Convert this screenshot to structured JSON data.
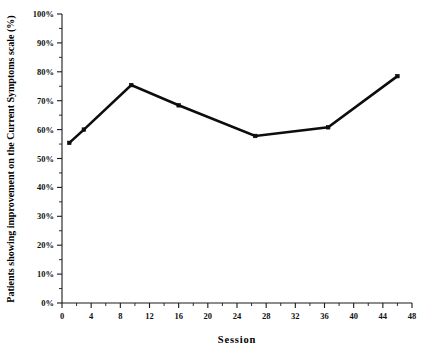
{
  "chart_data": {
    "type": "line",
    "title": "",
    "xlabel": "Session",
    "ylabel": "Patients showing improvement on the Current Symptoms scale (%)",
    "xlim": [
      0,
      48
    ],
    "ylim": [
      0,
      100
    ],
    "xticks": [
      0,
      4,
      8,
      12,
      16,
      20,
      24,
      28,
      32,
      36,
      40,
      44,
      48
    ],
    "xtick_labels": [
      "0",
      "4",
      "8",
      "12",
      "16",
      "20",
      "24",
      "28",
      "32",
      "36",
      "40",
      "44",
      "48"
    ],
    "x_minor_step": 2,
    "yticks": [
      0,
      10,
      20,
      30,
      40,
      50,
      60,
      70,
      80,
      90,
      100
    ],
    "ytick_labels": [
      "0%",
      "10%",
      "20%",
      "30%",
      "40%",
      "50%",
      "60%",
      "70%",
      "80%",
      "90%",
      "100%"
    ],
    "y_minor_step": 5,
    "grid": false,
    "legend": false,
    "legend_position": "none",
    "marker": "square",
    "line_color": "#0d0d0d",
    "marker_color": "#0d0d0d",
    "background_color": "#ffffff",
    "x": [
      1,
      3,
      9.5,
      16,
      26.5,
      36.5,
      46
    ],
    "values": [
      55.4,
      60.0,
      75.4,
      68.4,
      57.8,
      60.8,
      78.5
    ],
    "series": [
      {
        "name": "Patients showing improvement",
        "x": [
          1,
          3,
          9.5,
          16,
          26.5,
          36.5,
          46
        ],
        "values": [
          55.4,
          60.0,
          75.4,
          68.4,
          57.8,
          60.8,
          78.5
        ]
      }
    ],
    "points": [
      {
        "session": 1,
        "percent": 55.4,
        "label": "55%"
      },
      {
        "session": 3,
        "percent": 60.0,
        "label": "60%"
      },
      {
        "session": 9.5,
        "percent": 75.4,
        "label": "75%"
      },
      {
        "session": 16,
        "percent": 68.4,
        "label": "68%"
      },
      {
        "session": 26.5,
        "percent": 57.8,
        "label": "58%"
      },
      {
        "session": 36.5,
        "percent": 60.8,
        "label": "61%"
      },
      {
        "session": 46,
        "percent": 78.5,
        "label": "78%"
      }
    ]
  }
}
